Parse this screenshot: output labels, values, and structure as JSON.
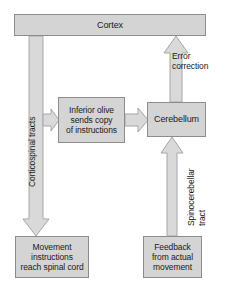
{
  "diagram": {
    "colors": {
      "box_fill": "#d4d4d4",
      "box_border": "#8d8d8d",
      "arrow_fill": "#d9d9d9",
      "arrow_border": "#a6a6a6",
      "text": "#1a1a1a",
      "background": "#ffffff"
    },
    "nodes": {
      "cortex": {
        "label": "Cortex"
      },
      "inferior_olive": {
        "line1": "Inferior olive",
        "line2": "sends copy",
        "line3": "of instructions"
      },
      "cerebellum": {
        "label": "Cerebellum"
      },
      "movement": {
        "line1": "Movement",
        "line2": "instructions",
        "line3": "reach spinal cord"
      },
      "feedback": {
        "line1": "Feedback",
        "line2": "from actual",
        "line3": "movement"
      }
    },
    "edge_labels": {
      "corticospinal_tracts": "Corticospinal tracts",
      "error_correction_line1": "Error",
      "error_correction_line2": "correction",
      "spinocerebellar_line1": "Spinocerebellar",
      "spinocerebellar_line2": "tract"
    },
    "arrows": [
      {
        "name": "cortex-to-spinal-cord",
        "direction": "down"
      },
      {
        "name": "cortex-branch-to-inferior-olive",
        "direction": "right"
      },
      {
        "name": "inferior-olive-to-cerebellum",
        "direction": "right"
      },
      {
        "name": "cerebellum-to-cortex",
        "direction": "up"
      },
      {
        "name": "feedback-to-cerebellum",
        "direction": "up"
      }
    ]
  }
}
